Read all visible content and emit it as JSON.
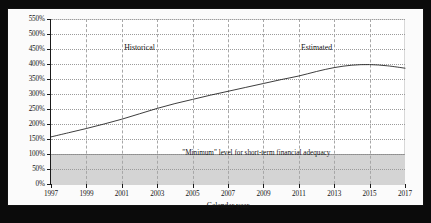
{
  "figure": {
    "background_color": "#0b0b0b",
    "canvas_color": "#fbfbfb",
    "band_color": "#d4d4d4",
    "line_color": "#1a1a1a"
  },
  "annotations": {
    "historical_label": "Historical",
    "estimated_label": "Estimated",
    "minimum_note": "\"Minimum\" level for short-term financial adequacy"
  },
  "chart_data": {
    "type": "line",
    "title": "",
    "subtitle": "",
    "xlabel": "Calendar year",
    "ylabel": "",
    "xlim": [
      1997,
      2017
    ],
    "ylim": [
      0,
      550
    ],
    "y_tick_labels": [
      "0%",
      "50%",
      "100%",
      "150%",
      "200%",
      "250%",
      "300%",
      "350%",
      "400%",
      "450%",
      "500%",
      "550%"
    ],
    "y_ticks": [
      0,
      50,
      100,
      150,
      200,
      250,
      300,
      350,
      400,
      450,
      500,
      550
    ],
    "x_tick_labels": [
      "1997",
      "1999",
      "2001",
      "2003",
      "2005",
      "2007",
      "2009",
      "2011",
      "2013",
      "2015",
      "2017"
    ],
    "x_ticks": [
      1997,
      1999,
      2001,
      2003,
      2005,
      2007,
      2009,
      2011,
      2013,
      2015,
      2017
    ],
    "grid": true,
    "legend": "none",
    "shaded_region": {
      "label": "\"Minimum\" level for short-term financial adequacy",
      "y_from": 0,
      "y_to": 100
    },
    "regions": [
      {
        "name": "Historical",
        "x_from": 1997,
        "x_to": 2007,
        "label_x": 2002
      },
      {
        "name": "Estimated",
        "x_from": 2007,
        "x_to": 2017,
        "label_x": 2012
      }
    ],
    "series": [
      {
        "name": "Trust fund ratio",
        "x": [
          1997,
          1998,
          1999,
          2000,
          2001,
          2002,
          2003,
          2004,
          2005,
          2006,
          2007,
          2008,
          2009,
          2010,
          2011,
          2012,
          2013,
          2014,
          2015,
          2016,
          2017
        ],
        "values": [
          157,
          171,
          185,
          200,
          216,
          234,
          252,
          268,
          282,
          296,
          309,
          322,
          335,
          348,
          360,
          375,
          388,
          396,
          398,
          394,
          386
        ]
      }
    ]
  }
}
